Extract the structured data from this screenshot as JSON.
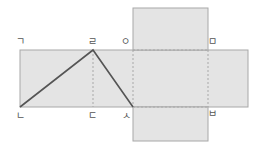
{
  "diagram": {
    "fill_color": "#e4e4e4",
    "edge_color": "#a8a8a8",
    "line_color": "#555555",
    "labels": {
      "g": "ㄱ",
      "r": "ㄹ",
      "o": "ㅇ",
      "m": "ㅁ",
      "n": "ㄴ",
      "d": "ㄷ",
      "s": "ㅅ",
      "b": "ㅂ"
    }
  }
}
